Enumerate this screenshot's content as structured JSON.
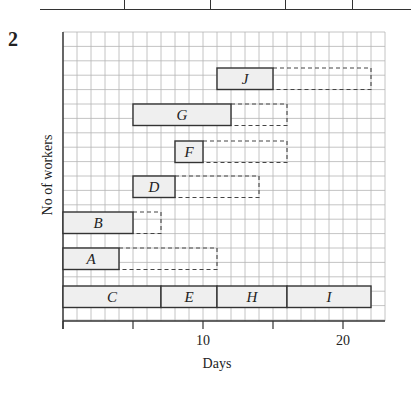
{
  "question_number": "2",
  "table_strip": {
    "dividers_x": [
      124,
      210,
      285,
      352
    ]
  },
  "chart_data": {
    "type": "gantt",
    "title": "",
    "xlabel": "Days",
    "ylabel": "No of workers",
    "xlim": [
      0,
      23
    ],
    "x_ticks": [
      0,
      5,
      10,
      15,
      20
    ],
    "x_tick_labels": [
      "",
      "",
      "10",
      "",
      "20"
    ],
    "grid": true,
    "activities": [
      {
        "name": "J",
        "start": 11,
        "end": 15,
        "float_end": 22,
        "row": 1
      },
      {
        "name": "G",
        "start": 5,
        "end": 12,
        "float_end": 16,
        "row": 2
      },
      {
        "name": "F",
        "start": 8,
        "end": 10,
        "float_end": 16,
        "row": 3
      },
      {
        "name": "D",
        "start": 5,
        "end": 8,
        "float_end": 14,
        "row": 4
      },
      {
        "name": "B",
        "start": 0,
        "end": 5,
        "float_end": 7,
        "row": 5
      },
      {
        "name": "A",
        "start": 0,
        "end": 4,
        "float_end": 11,
        "row": 6
      },
      {
        "name": "C",
        "start": 0,
        "end": 7,
        "float_end": 7,
        "row": 7
      },
      {
        "name": "E",
        "start": 7,
        "end": 11,
        "float_end": 11,
        "row": 7
      },
      {
        "name": "H",
        "start": 11,
        "end": 16,
        "float_end": 16,
        "row": 7
      },
      {
        "name": "I",
        "start": 16,
        "end": 22,
        "float_end": 22,
        "row": 7
      }
    ],
    "colors": {
      "bar_fill": "#efefef",
      "bar_stroke": "#333333",
      "grid": "#b5b5b5",
      "float_stroke": "#444444"
    }
  }
}
